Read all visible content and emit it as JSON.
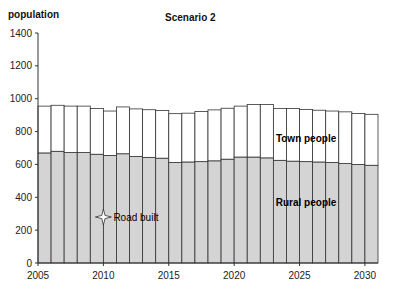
{
  "chart_data": {
    "type": "bar",
    "stacked": true,
    "title": "Scenario 2",
    "xlabel": "",
    "ylabel": "population",
    "ylim": [
      0,
      1400
    ],
    "yticks": [
      0,
      200,
      400,
      600,
      800,
      1000,
      1200,
      1400
    ],
    "xticks": [
      2005,
      2010,
      2015,
      2020,
      2025,
      2030
    ],
    "categories": [
      2005,
      2006,
      2007,
      2008,
      2009,
      2010,
      2011,
      2012,
      2013,
      2014,
      2015,
      2016,
      2017,
      2018,
      2019,
      2020,
      2021,
      2022,
      2023,
      2024,
      2025,
      2026,
      2027,
      2028,
      2029,
      2030
    ],
    "series": [
      {
        "name": "Rural people",
        "color": "#d4d4d4",
        "values": [
          670,
          680,
          672,
          672,
          662,
          655,
          665,
          648,
          643,
          638,
          612,
          615,
          617,
          622,
          632,
          645,
          645,
          640,
          625,
          620,
          617,
          615,
          612,
          605,
          600,
          595
        ]
      },
      {
        "name": "Town people",
        "color": "#ffffff",
        "values": [
          285,
          280,
          283,
          283,
          278,
          270,
          285,
          290,
          290,
          290,
          297,
          297,
          305,
          310,
          310,
          310,
          320,
          325,
          315,
          320,
          318,
          315,
          313,
          315,
          310,
          310
        ]
      }
    ],
    "annotations": [
      {
        "text": "Road built",
        "x": 2009.5,
        "y": 280,
        "marker": "star"
      },
      {
        "text": "Town people",
        "x": 2025,
        "y": 760
      },
      {
        "text": "Rural people",
        "x": 2025,
        "y": 370
      }
    ],
    "grid": false,
    "legend": "inline labels"
  }
}
